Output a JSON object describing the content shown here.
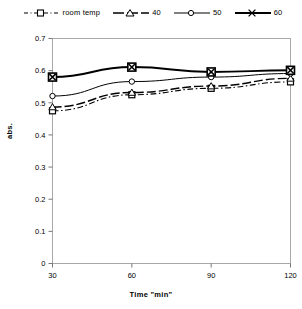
{
  "chart_data": {
    "type": "line",
    "title": "",
    "xlabel": "Time \"min\"",
    "ylabel": "abs.",
    "x": [
      30,
      60,
      90,
      120
    ],
    "xticklabels": [
      "30",
      "60",
      "90",
      "120"
    ],
    "yticklabels": [
      "0",
      "0.1",
      "0.2",
      "0.3",
      "0.4",
      "0.5",
      "0.6",
      "0.7"
    ],
    "yticks": [
      0,
      0.1,
      0.2,
      0.3,
      0.4,
      0.5,
      0.6,
      0.7
    ],
    "xlim": [
      30,
      120
    ],
    "ylim": [
      0,
      0.7
    ],
    "grid": false,
    "legend_position": "top",
    "series": [
      {
        "name": "room temp",
        "values": [
          0.475,
          0.525,
          0.545,
          0.565
        ],
        "marker": "square",
        "line": "dash-dot",
        "color": "#000000",
        "width": 1.1
      },
      {
        "name": "40",
        "values": [
          0.487,
          0.532,
          0.552,
          0.576
        ],
        "marker": "triangle",
        "line": "dashed",
        "color": "#000000",
        "width": 1.4
      },
      {
        "name": "50",
        "values": [
          0.521,
          0.566,
          0.58,
          0.591
        ],
        "marker": "circle",
        "line": "solid",
        "color": "#000000",
        "width": 1.0
      },
      {
        "name": "60",
        "values": [
          0.58,
          0.611,
          0.596,
          0.601
        ],
        "marker": "cross",
        "line": "solid",
        "color": "#000000",
        "width": 2.0
      }
    ]
  },
  "legend": {
    "items": [
      {
        "label": "room temp",
        "swatch": "dashdot-square-swatch"
      },
      {
        "label": "40",
        "swatch": "dashed-triangle-swatch"
      },
      {
        "label": "50",
        "swatch": "solid-circle-swatch"
      },
      {
        "label": "60",
        "swatch": "thick-cross-swatch"
      }
    ]
  },
  "axes": {
    "x_title": "Time \"min\"",
    "y_title": "abs."
  }
}
